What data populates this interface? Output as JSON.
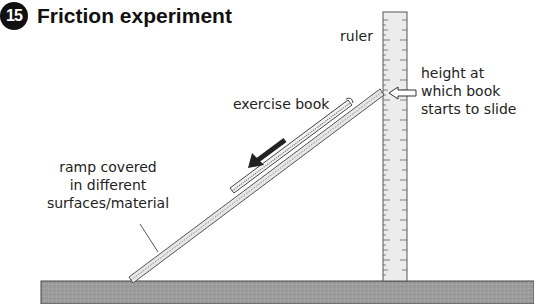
{
  "header": {
    "number": "15",
    "title": "Friction experiment"
  },
  "labels": {
    "ruler": "ruler",
    "height_line1": "height at",
    "height_line2": "which book",
    "height_line3": "starts to slide",
    "exercise_book": "exercise book",
    "ramp_line1": "ramp covered",
    "ramp_line2": "in different",
    "ramp_line3": "surfaces/material"
  },
  "colors": {
    "table": "#9a9a9a",
    "ruler": "#ececec",
    "outline": "#444444",
    "arrow": "#222222"
  }
}
